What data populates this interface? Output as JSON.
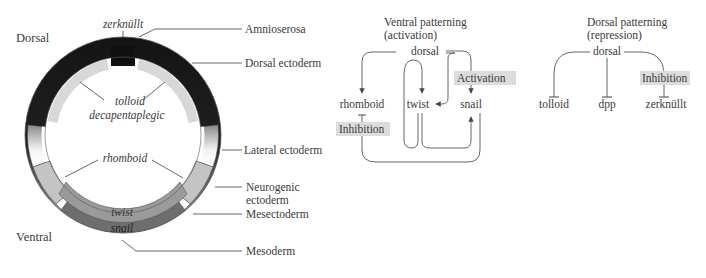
{
  "ring_diagram": {
    "axis_labels": {
      "dorsal": "Dorsal",
      "ventral": "Ventral"
    },
    "inner_gene_labels": {
      "top": "zerknüllt",
      "dorsal_line1": "tolloid",
      "dorsal_line2": "decapentaplegic",
      "lateral": "rhomboid",
      "twist": "twist",
      "snail": "snail"
    },
    "tissue_labels": [
      "Amnioserosa",
      "Dorsal ectoderm",
      "Lateral ectoderm",
      "Neurogenic",
      "ectoderm",
      "Mesectoderm",
      "Mesoderm"
    ],
    "colors": {
      "dorsal_dark": "#151515",
      "light_band": "#d8d8d8",
      "neurogenic": "#c4c4c4",
      "twist": "#9a9a9a",
      "snail": "#6e6e6e",
      "outline": "#555555"
    }
  },
  "ventral_patterning": {
    "title_line1": "Ventral patterning",
    "title_line2": "(activation)",
    "source": "dorsal",
    "targets": [
      "rhomboid",
      "twist",
      "snail"
    ],
    "badges": {
      "activation": "Activation",
      "inhibition": "Inhibition"
    }
  },
  "dorsal_patterning": {
    "title_line1": "Dorsal patterning",
    "title_line2": "(repression)",
    "source": "dorsal",
    "targets": [
      "tolloid",
      "dpp",
      "zerknüllt"
    ],
    "badges": {
      "inhibition": "Inhibition"
    }
  }
}
